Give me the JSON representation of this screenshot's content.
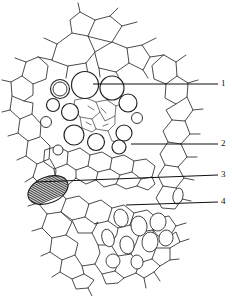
{
  "figure": {
    "kind": "botanical-line-drawing",
    "background_color": "#ffffff",
    "ink_color": "#222222",
    "width": 232,
    "height": 296
  },
  "labels": [
    {
      "id": "label-1",
      "text": "1",
      "x": 222,
      "y": 79,
      "leader": {
        "x1": 93,
        "y1": 84,
        "x2": 218,
        "y2": 84
      }
    },
    {
      "id": "label-2",
      "text": "2",
      "x": 222,
      "y": 139,
      "leader": {
        "x1": 131,
        "y1": 144,
        "x2": 218,
        "y2": 144
      }
    },
    {
      "id": "label-3",
      "text": "3",
      "x": 222,
      "y": 169,
      "leader": {
        "x1": 36,
        "y1": 182,
        "x2": 218,
        "y2": 175
      }
    },
    {
      "id": "label-4",
      "text": "4",
      "x": 222,
      "y": 197,
      "leader": {
        "x1": 126,
        "y1": 205,
        "x2": 218,
        "y2": 202
      }
    }
  ],
  "structures": {
    "vessels_large": [
      {
        "name": "metaxylem-vessel-1",
        "cx": 60,
        "cy": 89,
        "r": 9.5
      },
      {
        "name": "metaxylem-vessel-2",
        "cx": 85,
        "cy": 85,
        "r": 13.5
      },
      {
        "name": "metaxylem-vessel-3",
        "cx": 112,
        "cy": 88,
        "r": 12.0
      },
      {
        "name": "metaxylem-vessel-4",
        "cx": 128,
        "cy": 103,
        "r": 9.0
      },
      {
        "name": "metaxylem-vessel-5",
        "cx": 70,
        "cy": 112,
        "r": 8.5
      },
      {
        "name": "metaxylem-vessel-6",
        "cx": 74,
        "cy": 135,
        "r": 10.0
      },
      {
        "name": "metaxylem-vessel-7",
        "cx": 96,
        "cy": 142,
        "r": 8.5
      },
      {
        "name": "metaxylem-vessel-8",
        "cx": 124,
        "cy": 133,
        "r": 8.0
      },
      {
        "name": "metaxylem-vessel-9",
        "cx": 119,
        "cy": 147,
        "r": 7.0
      },
      {
        "name": "protoxylem-vessel",
        "cx": 53,
        "cy": 105,
        "r": 6.5
      }
    ],
    "hatched_cell": {
      "name": "annular-thickened-vessel",
      "cx": 48,
      "cy": 190,
      "rx": 21,
      "ry": 13,
      "rotation": -22,
      "hatch_count": 14
    },
    "phloem_cells_oval": [
      {
        "cx": 121,
        "cy": 218,
        "rx": 7,
        "ry": 9,
        "rot": -15
      },
      {
        "cx": 139,
        "cy": 226,
        "rx": 8,
        "ry": 10,
        "rot": -10
      },
      {
        "cx": 158,
        "cy": 222,
        "rx": 8,
        "ry": 9,
        "rot": 8
      },
      {
        "cx": 108,
        "cy": 238,
        "rx": 6,
        "ry": 9,
        "rot": -18
      },
      {
        "cx": 127,
        "cy": 245,
        "rx": 7,
        "ry": 9,
        "rot": -12
      },
      {
        "cx": 150,
        "cy": 242,
        "rx": 8,
        "ry": 10,
        "rot": 5
      },
      {
        "cx": 166,
        "cy": 238,
        "rx": 7,
        "ry": 8,
        "rot": 12
      },
      {
        "cx": 113,
        "cy": 261,
        "rx": 7,
        "ry": 7,
        "rot": 0
      },
      {
        "cx": 137,
        "cy": 262,
        "rx": 6,
        "ry": 7,
        "rot": -8
      }
    ]
  },
  "caption": ""
}
